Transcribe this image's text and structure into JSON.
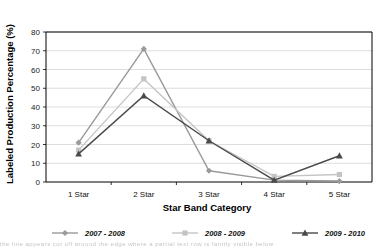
{
  "chart_data": {
    "type": "line",
    "title": "",
    "xlabel": "Star Band Category",
    "ylabel": "Labeled Production Percentage (%)",
    "categories": [
      "1 Star",
      "2 Star",
      "3 Star",
      "4 Star",
      "5 Star"
    ],
    "ylim": [
      0,
      80
    ],
    "yticks": [
      0,
      10,
      20,
      30,
      40,
      50,
      60,
      70,
      80
    ],
    "ytick_labels": [
      "0",
      "10",
      "20",
      "30",
      "40",
      "50",
      "60",
      "70",
      "80"
    ],
    "grid": true,
    "legend_position": "bottom",
    "series": [
      {
        "name": "2007 - 2008",
        "marker": "diamond",
        "color": "#9a9a9a",
        "values": [
          21,
          71,
          6,
          1,
          0.5
        ]
      },
      {
        "name": "2008 - 2009",
        "marker": "square",
        "color": "#c4c4c4",
        "values": [
          17,
          55,
          22,
          3,
          4
        ]
      },
      {
        "name": "2009 - 2010",
        "marker": "triangle",
        "color": "#4a4a4a",
        "values": [
          15,
          46,
          22,
          1,
          14
        ]
      }
    ]
  },
  "axes": {
    "y_title": "Labeled Production Percentage (%)",
    "x_title": "Star Band Category"
  },
  "legend": {
    "items": [
      {
        "label": "2007 - 2008",
        "marker": "diamond-marker-icon",
        "color": "#9a9a9a"
      },
      {
        "label": "2008 - 2009",
        "marker": "square-marker-icon",
        "color": "#c4c4c4"
      },
      {
        "label": "2009 - 2010",
        "marker": "triangle-marker-icon",
        "color": "#4a4a4a"
      }
    ]
  },
  "footer": {
    "smudge": "the line appears cut off around the edge where a partial text row is faintly visible below"
  }
}
